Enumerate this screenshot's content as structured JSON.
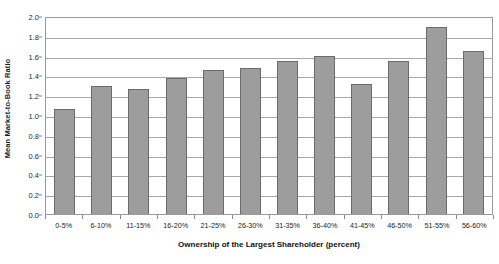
{
  "chart_data": {
    "type": "bar",
    "title": "",
    "xlabel": "Ownership of the Largest Shareholder (percent)",
    "ylabel": "Mean Market-to-Book Ratio",
    "categories": [
      "0-5%",
      "6-10%",
      "11-15%",
      "16-20%",
      "21-25%",
      "26-30%",
      "31-35%",
      "36-40%",
      "41-45%",
      "46-50%",
      "51-55%",
      "56-60%"
    ],
    "values": [
      1.06,
      1.29,
      1.26,
      1.37,
      1.45,
      1.47,
      1.55,
      1.6,
      1.31,
      1.55,
      1.89,
      1.65
    ],
    "ylim": [
      0.0,
      2.0
    ],
    "ytick_labels": [
      "0.0",
      "0.2",
      "0.4",
      "0.6",
      "0.8",
      "1.0",
      "1.2",
      "1.4",
      "1.6",
      "1.8",
      "2.0"
    ],
    "ytick_values": [
      0.0,
      0.2,
      0.4,
      0.6,
      0.8,
      1.0,
      1.2,
      1.4,
      1.6,
      1.8,
      2.0
    ],
    "grid": true,
    "legend": "none",
    "bar_color": "#9d9d9d",
    "bar_border_color": "#6b6b6b",
    "gridline_color": "#a8a8a8",
    "plot_border_color": "#9a9a9a",
    "background_color": "#ffffff"
  }
}
